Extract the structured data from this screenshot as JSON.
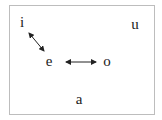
{
  "diagram": {
    "type": "vowel-chart",
    "vowels": [
      {
        "id": "i",
        "label": "i",
        "x": 22,
        "y": 23
      },
      {
        "id": "u",
        "label": "u",
        "x": 135,
        "y": 23
      },
      {
        "id": "e",
        "label": "e",
        "x": 49,
        "y": 62
      },
      {
        "id": "o",
        "label": "o",
        "x": 107,
        "y": 62
      },
      {
        "id": "a",
        "label": "a",
        "x": 79,
        "y": 100
      }
    ],
    "arrows": [
      {
        "from": "i",
        "to": "e",
        "type": "bidirectional"
      },
      {
        "from": "e",
        "to": "o",
        "type": "bidirectional"
      }
    ],
    "colors": {
      "text": "#222222",
      "arrow": "#222222",
      "border": "#bdbdbd"
    }
  }
}
